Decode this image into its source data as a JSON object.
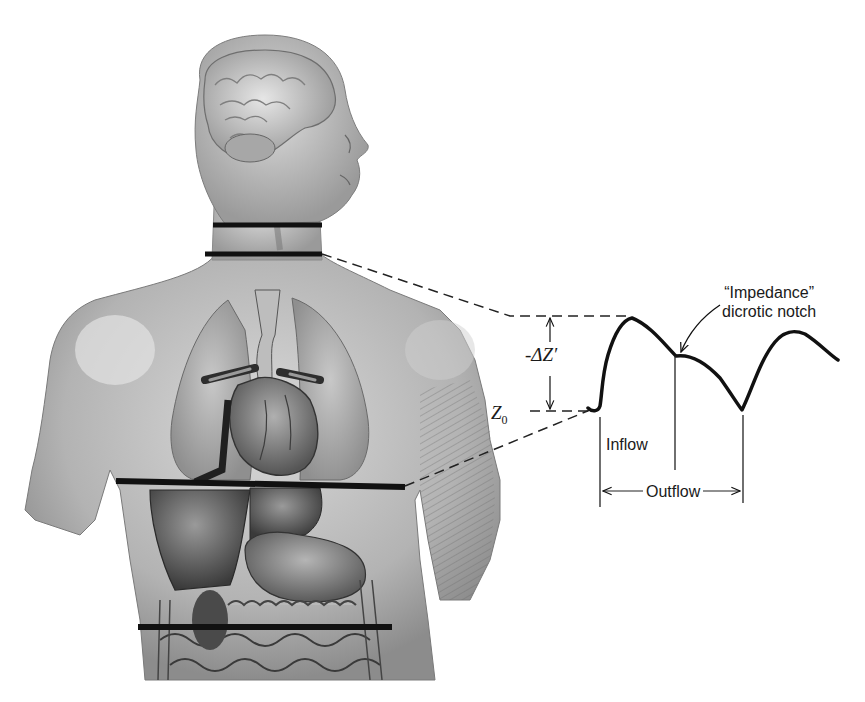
{
  "figure": {
    "electrode_bands": [
      {
        "name": "upper-neck-band",
        "y": 225
      },
      {
        "name": "lower-neck-band",
        "y": 255
      },
      {
        "name": "thorax-band",
        "y": 483
      },
      {
        "name": "abdomen-band",
        "y": 627
      }
    ],
    "colors": {
      "ink": "#111111",
      "skin_light": "#d4d4d4",
      "skin_mid": "#a8a8a8",
      "organ_dark": "#4a4a4a",
      "background": "#ffffff"
    }
  },
  "waveform": {
    "annotation_line1": "“Impedance”",
    "annotation_line2": "dicrotic notch",
    "delta_label": "-ΔZ′",
    "baseline_label": "Z",
    "baseline_subscript": "0",
    "inflow_label": "Inflow",
    "outflow_label": "Outflow"
  }
}
